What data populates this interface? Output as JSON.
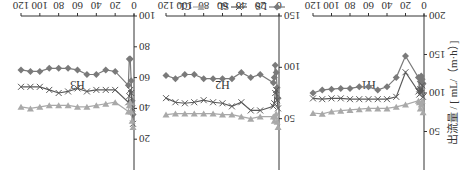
{
  "chart_data": {
    "type": "line",
    "orientation_note": "image rendered rotated 180 degrees",
    "ylabel": "出流量 / [ mL/（m·h）]",
    "xlabel": "入渗时间/h",
    "legend": [
      {
        "name": "LS",
        "marker": "diamond",
        "color": "#7a7a7a"
      },
      {
        "name": "SL",
        "marker": "x",
        "color": "#5a5a5a"
      },
      {
        "name": "CL",
        "marker": "triangle-down",
        "color": "#a9a9a9"
      }
    ],
    "x_ticks": [
      0,
      20,
      40,
      60,
      80,
      100,
      120
    ],
    "panels": [
      {
        "label": "H1",
        "ylim": [
          0,
          200
        ],
        "y_ticks": [
          50,
          100,
          150,
          200
        ],
        "x": [
          1,
          2,
          3,
          4,
          5,
          6,
          20,
          30,
          40,
          50,
          60,
          70,
          80,
          90,
          100,
          110,
          120
        ],
        "series": [
          {
            "name": "LS",
            "values": [
              112,
              118,
              122,
              115,
              105,
              120,
              148,
              120,
              108,
              104,
              108,
              108,
              106,
              106,
              105,
              104,
              100
            ]
          },
          {
            "name": "SL",
            "values": [
              95,
              110,
              100,
              105,
              98,
              102,
              127,
              95,
              92,
              92,
              92,
              92,
              92,
              93,
              93,
              92,
              93
            ]
          },
          {
            "name": "CL",
            "values": [
              75,
              90,
              85,
              80,
              88,
              90,
              85,
              82,
              80,
              80,
              80,
              79,
              78,
              77,
              76,
              73,
              74
            ]
          }
        ]
      },
      {
        "label": "H2",
        "ylim": [
          0,
          150
        ],
        "y_ticks": [
          50,
          100,
          150
        ],
        "x": [
          1,
          2,
          3,
          4,
          5,
          6,
          20,
          30,
          40,
          50,
          60,
          70,
          80,
          90,
          100,
          110,
          120
        ],
        "series": [
          {
            "name": "LS",
            "values": [
              70,
              80,
              95,
              102,
              90,
              85,
              93,
              90,
              95,
              89,
              89,
              89,
              89,
              93,
              93,
              89,
              92
            ]
          },
          {
            "name": "SL",
            "values": [
              60,
              68,
              78,
              75,
              65,
              62,
              58,
              58,
              66,
              62,
              65,
              66,
              68,
              66,
              65,
              66,
              70
            ]
          },
          {
            "name": "CL",
            "values": [
              42,
              47,
              55,
              52,
              48,
              52,
              52,
              50,
              52,
              54,
              54,
              55,
              55,
              55,
              55,
              55,
              54
            ]
          }
        ]
      },
      {
        "label": "H3",
        "ylim": [
          0,
          100
        ],
        "y_ticks": [
          20,
          40,
          60,
          80,
          100
        ],
        "x": [
          1,
          2,
          3,
          4,
          5,
          6,
          20,
          30,
          40,
          50,
          60,
          70,
          80,
          90,
          100,
          110,
          120
        ],
        "series": [
          {
            "name": "LS",
            "values": [
              36,
              45,
              58,
              72,
              72,
              55,
              64,
              65,
              62,
              62,
              65,
              66,
              66,
              66,
              64,
              64,
              65
            ]
          },
          {
            "name": "SL",
            "values": [
              30,
              40,
              50,
              52,
              48,
              44,
              52,
              52,
              52,
              51,
              53,
              51,
              50,
              52,
              54,
              54,
              54
            ]
          },
          {
            "name": "CL",
            "values": [
              28,
              32,
              38,
              44,
              42,
              38,
              44,
              43,
              42,
              41,
              41,
              42,
              42,
              42,
              41,
              40,
              41
            ]
          }
        ]
      }
    ]
  }
}
